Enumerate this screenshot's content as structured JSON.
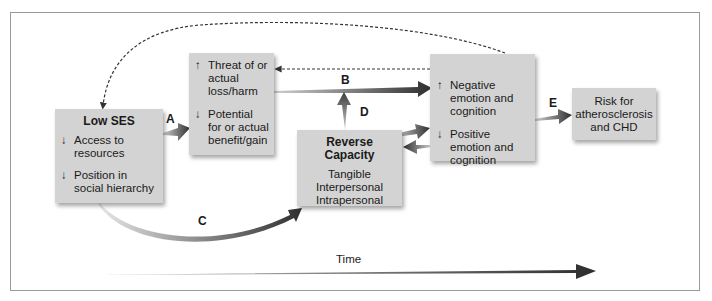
{
  "boxes": {
    "low_ses": {
      "title": "Low SES",
      "items": [
        {
          "arrow": "↓",
          "text": "Access to resources"
        },
        {
          "arrow": "↓",
          "text": "Position in social hierarchy"
        }
      ]
    },
    "threat": {
      "items": [
        {
          "arrow": "↑",
          "text": "Threat of or actual loss/harm"
        },
        {
          "arrow": "↓",
          "text": "Potential for or actual benefit/gain"
        }
      ]
    },
    "reserve": {
      "title": "Reverse Capacity",
      "lines": [
        "Tangible",
        "Interpersonal",
        "Intrapersonal"
      ]
    },
    "emotion": {
      "items": [
        {
          "arrow": "↑",
          "text": "Negative emotion and cognition"
        },
        {
          "arrow": "↓",
          "text": "Positive emotion and cognition"
        }
      ]
    },
    "risk": {
      "text": "Risk for atherosclerosis and CHD"
    }
  },
  "path_labels": {
    "a": "A",
    "b": "B",
    "c": "C",
    "d": "D",
    "e": "E"
  },
  "timeline": {
    "label": "Time"
  },
  "colors": {
    "box_fill": "#d3d3d3",
    "arrow_dark": "#3a3a3a",
    "frame": "#9a9a9a"
  }
}
